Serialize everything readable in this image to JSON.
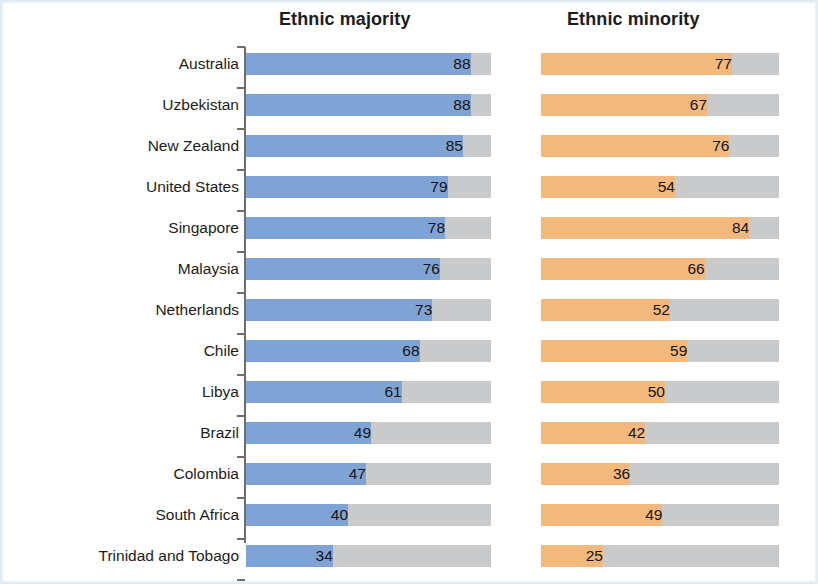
{
  "figure": {
    "background_color": "#ffffff",
    "border_color": "#dce9f0"
  },
  "panels": {
    "majority_title": "Ethnic majority",
    "minority_title": "Ethnic minority"
  },
  "colors": {
    "majority_bar": "#7fa3d4",
    "minority_bar": "#f2b87c",
    "track": "#c8cacb",
    "axis": "#6d6d6d",
    "text": "#1c1c1c"
  },
  "chart_data": {
    "type": "bar",
    "title": "",
    "orientation": "horizontal",
    "grid": false,
    "legend_position": "none",
    "xlabel": "",
    "ylabel": "",
    "xlim": [
      0,
      96
    ],
    "categories": [
      "Australia",
      "Uzbekistan",
      "New Zealand",
      "United States",
      "Singapore",
      "Malaysia",
      "Netherlands",
      "Chile",
      "Libya",
      "Brazil",
      "Colombia",
      "South Africa",
      "Trinidad and Tobago"
    ],
    "series": [
      {
        "name": "Ethnic majority",
        "color": "#7fa3d4",
        "values": [
          88,
          88,
          85,
          79,
          78,
          76,
          73,
          68,
          61,
          49,
          47,
          40,
          34
        ]
      },
      {
        "name": "Ethnic minority",
        "color": "#f2b87c",
        "values": [
          77,
          67,
          76,
          54,
          84,
          66,
          52,
          59,
          50,
          42,
          36,
          49,
          25
        ]
      }
    ]
  }
}
